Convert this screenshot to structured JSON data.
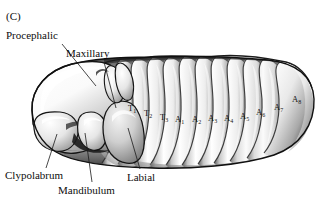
{
  "figure": {
    "panel_label": "(C)",
    "background_color": "#ffffff",
    "ink_color": "#111111",
    "view": "lateral"
  },
  "annotations": [
    {
      "id": "procephalic",
      "label": "Procephalic",
      "x": 6,
      "y": 30,
      "leader": {
        "x1": 62,
        "y1": 44,
        "x2": 96,
        "y2": 86
      }
    },
    {
      "id": "maxillary",
      "label": "Maxillary",
      "x": 66,
      "y": 48,
      "leader": {
        "x1": 104,
        "y1": 62,
        "x2": 116,
        "y2": 108
      }
    },
    {
      "id": "clypolabrum",
      "label": "Clypolabrum",
      "x": 5,
      "y": 170,
      "leader": {
        "x1": 46,
        "y1": 168,
        "x2": 57,
        "y2": 134
      }
    },
    {
      "id": "mandibulum",
      "label": "Mandibulum",
      "x": 58,
      "y": 185,
      "leader": {
        "x1": 92,
        "y1": 182,
        "x2": 85,
        "y2": 133
      }
    },
    {
      "id": "labial",
      "label": "Labial",
      "x": 127,
      "y": 172,
      "leader": {
        "x1": 140,
        "y1": 169,
        "x2": 128,
        "y2": 128
      }
    }
  ],
  "segments": [
    {
      "id": "t1",
      "base": "T",
      "index": "1",
      "x": 128,
      "y": 104
    },
    {
      "id": "t2",
      "base": "T",
      "index": "2",
      "x": 144,
      "y": 109
    },
    {
      "id": "t3",
      "base": "T",
      "index": "3",
      "x": 160,
      "y": 113
    },
    {
      "id": "a1",
      "base": "A",
      "index": "1",
      "x": 175,
      "y": 115
    },
    {
      "id": "a2",
      "base": "A",
      "index": "2",
      "x": 192,
      "y": 115
    },
    {
      "id": "a3",
      "base": "A",
      "index": "3",
      "x": 208,
      "y": 114
    },
    {
      "id": "a4",
      "base": "A",
      "index": "4",
      "x": 224,
      "y": 114
    },
    {
      "id": "a5",
      "base": "A",
      "index": "5",
      "x": 240,
      "y": 112
    },
    {
      "id": "a6",
      "base": "A",
      "index": "6",
      "x": 256,
      "y": 108
    },
    {
      "id": "a7",
      "base": "A",
      "index": "7",
      "x": 274,
      "y": 103
    },
    {
      "id": "a8",
      "base": "A",
      "index": "8",
      "x": 292,
      "y": 95
    }
  ]
}
